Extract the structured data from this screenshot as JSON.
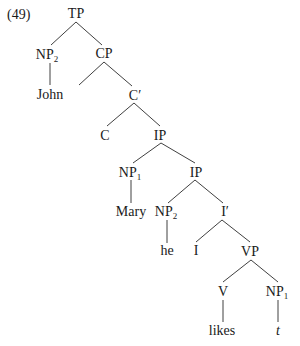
{
  "example": {
    "number": "(49)"
  },
  "tree": {
    "nodes": {
      "tp": {
        "label": "TP",
        "sub": ""
      },
      "np2_top": {
        "label": "NP",
        "sub": "2"
      },
      "john": {
        "label": "John",
        "sub": ""
      },
      "cp": {
        "label": "CP",
        "sub": ""
      },
      "c_bar": {
        "label": "C′",
        "sub": ""
      },
      "c": {
        "label": "C",
        "sub": ""
      },
      "ip_upper": {
        "label": "IP",
        "sub": ""
      },
      "np1_mid": {
        "label": "NP",
        "sub": "1"
      },
      "mary": {
        "label": "Mary",
        "sub": ""
      },
      "ip_lower": {
        "label": "IP",
        "sub": ""
      },
      "np2_low": {
        "label": "NP",
        "sub": "2"
      },
      "he": {
        "label": "he",
        "sub": ""
      },
      "i_bar": {
        "label": "I′",
        "sub": ""
      },
      "i": {
        "label": "I",
        "sub": ""
      },
      "vp": {
        "label": "VP",
        "sub": ""
      },
      "v": {
        "label": "V",
        "sub": ""
      },
      "likes": {
        "label": "likes",
        "sub": ""
      },
      "np1_obj": {
        "label": "NP",
        "sub": "1"
      },
      "trace": {
        "label": "t",
        "sub": ""
      }
    }
  }
}
